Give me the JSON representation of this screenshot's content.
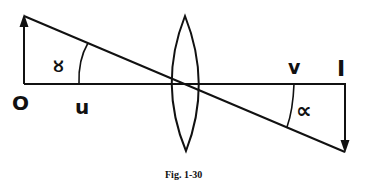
{
  "diagram": {
    "caption": "Fig. 1-30",
    "labels": {
      "object_point": "O",
      "object_distance": "u",
      "image_distance": "v",
      "image_point": "I",
      "angle_object": "∝",
      "angle_image": "∝"
    },
    "elements": {
      "optical_axis": "horizontal principal axis",
      "lens": "biconvex lens",
      "object_arrow": "upward arrow at O",
      "image_arrow": "downward inverted arrow at I",
      "ray": "straight line through lens center"
    },
    "colors": {
      "ink": "#111111",
      "background": "#ffffff"
    }
  }
}
